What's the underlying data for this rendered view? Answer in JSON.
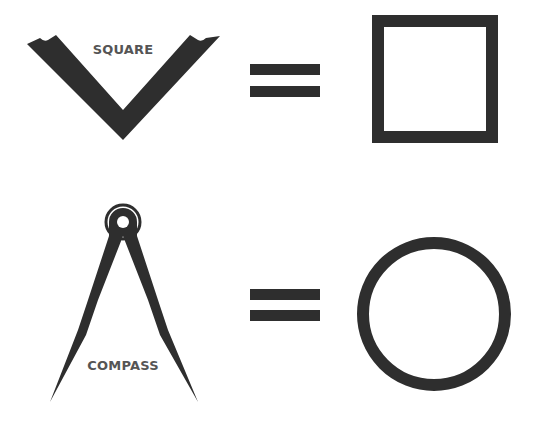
{
  "colors": {
    "ink": "#2e2e2e",
    "label": "#555555",
    "background": "#ffffff"
  },
  "rows": [
    {
      "tool": {
        "name": "square-tool",
        "label": "SQUARE"
      },
      "operator": "=",
      "result": {
        "shape": "square"
      }
    },
    {
      "tool": {
        "name": "compass-tool",
        "label": "COMPASS"
      },
      "operator": "=",
      "result": {
        "shape": "circle"
      }
    }
  ]
}
